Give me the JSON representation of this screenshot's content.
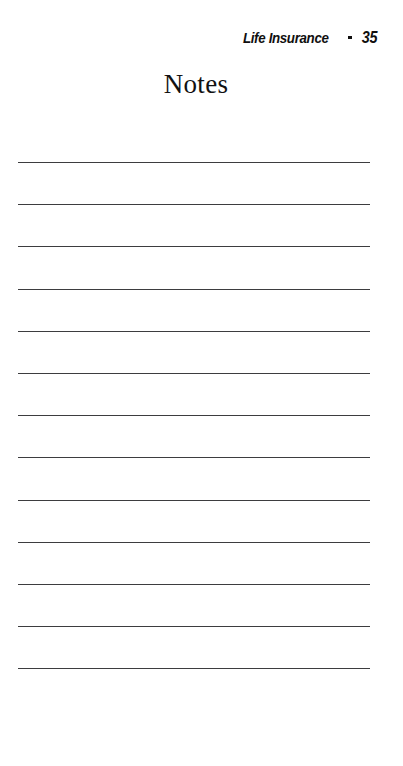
{
  "document": {
    "kind": "printed-book-page",
    "background_color": "#ffffff",
    "ink_color": "#100f0f",
    "rule_color": "#3d3d3f"
  },
  "running_head": {
    "section_title": "Life Insurance",
    "separator": "•",
    "separator_icon": "bullet-dot-icon",
    "page_number": "35"
  },
  "title": {
    "text": "Notes"
  },
  "notes_area": {
    "line_count": 13,
    "lines": [
      {
        "index": 1,
        "value": ""
      },
      {
        "index": 2,
        "value": ""
      },
      {
        "index": 3,
        "value": ""
      },
      {
        "index": 4,
        "value": ""
      },
      {
        "index": 5,
        "value": ""
      },
      {
        "index": 6,
        "value": ""
      },
      {
        "index": 7,
        "value": ""
      },
      {
        "index": 8,
        "value": ""
      },
      {
        "index": 9,
        "value": ""
      },
      {
        "index": 10,
        "value": ""
      },
      {
        "index": 11,
        "value": ""
      },
      {
        "index": 12,
        "value": ""
      },
      {
        "index": 13,
        "value": ""
      }
    ]
  }
}
